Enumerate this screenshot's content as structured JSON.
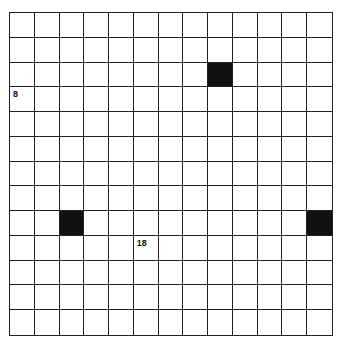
{
  "puzzle": {
    "rows": 13,
    "cols": 13,
    "black_cells": [
      [
        2,
        8
      ],
      [
        8,
        2
      ],
      [
        8,
        12
      ]
    ],
    "numbers": [
      {
        "row": 3,
        "col": 0,
        "label": "8"
      },
      {
        "row": 9,
        "col": 5,
        "label": "18"
      }
    ],
    "colors": {
      "line": "#222222",
      "black": "#111111",
      "background": "#ffffff"
    }
  }
}
